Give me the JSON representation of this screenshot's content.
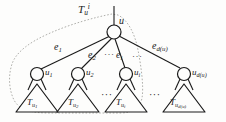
{
  "figure": {
    "name": "rooted-tree-subtree-diagram",
    "stroke_color": "#1a1a1a",
    "dash_color": "#9a9a96",
    "background_color": "#fdfdfc"
  },
  "labels": {
    "enclosure": {
      "base": "T",
      "sub": "u",
      "sup": "i"
    },
    "root_node": {
      "base": "u"
    },
    "edges": [
      {
        "base": "e",
        "sub": "1"
      },
      {
        "base": "e",
        "sub": "2"
      },
      {
        "base": "e",
        "sub": "i"
      },
      {
        "base": "e",
        "sub": "d(u)"
      }
    ],
    "children": [
      {
        "base": "u",
        "sub": "1"
      },
      {
        "base": "u",
        "sub": "2"
      },
      {
        "base": "u",
        "sub": "i"
      },
      {
        "base": "u",
        "sub": "d(u)"
      }
    ],
    "subtrees": [
      {
        "base": "T",
        "sub": "u",
        "subsub": "1"
      },
      {
        "base": "T",
        "sub": "u",
        "subsub": "2"
      },
      {
        "base": "T",
        "sub": "u",
        "subsub": "i"
      },
      {
        "base": "T",
        "sub": "u",
        "subsub": "d(u)"
      }
    ],
    "ellipsis": "···"
  }
}
